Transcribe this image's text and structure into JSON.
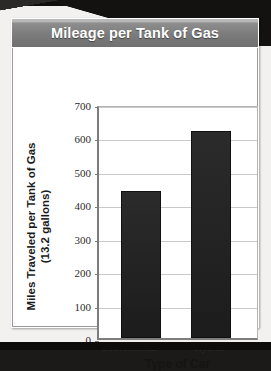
{
  "card": {
    "title": "Mileage per Tank of Gas"
  },
  "chart_data": {
    "type": "bar",
    "title": "Mileage per Tank of Gas",
    "categories": [
      "Conventional",
      "Hybrid"
    ],
    "values": [
      440,
      620
    ],
    "xlabel": "Type of Car",
    "ylabel": "Miles Traveled per Tank of Gas (13.2 gallons)",
    "ylabel_line1": "Miles Traveled per Tank of Gas",
    "ylabel_line2": "(13.2 gallons)",
    "ylim": [
      0,
      700
    ],
    "ytick_values": [
      0,
      100,
      200,
      300,
      400,
      500,
      600,
      700
    ],
    "ytick_labels": [
      "0",
      "100",
      "200",
      "300",
      "400",
      "500",
      "600",
      "700"
    ],
    "grid": true,
    "legend": false,
    "bar_color": "#232323",
    "gridline_color": "#c9c9c9",
    "axis_color": "#7d7d7d",
    "banner_color": "#7c7c7c",
    "title_color": "#ffffff"
  }
}
